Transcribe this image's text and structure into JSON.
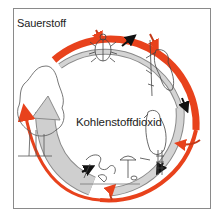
{
  "diagram": {
    "labels": {
      "oxygen": "Sauerstoff",
      "carbon_dioxide": "Kohlenstoffdioxid"
    },
    "colors": {
      "oxygen_arrow": "#e8421c",
      "co2_arrow": "#c8c8c8",
      "co2_arrow_outline": "#8a8a8a",
      "feeding_arrow": "#1a1a1a",
      "frame": "#8a8a8a"
    },
    "organisms": [
      {
        "name": "tree",
        "role": "producer"
      },
      {
        "name": "beetle",
        "role": "consumer"
      },
      {
        "name": "woodpecker",
        "role": "consumer"
      },
      {
        "name": "hawk",
        "role": "consumer"
      },
      {
        "name": "fungi and decomposers",
        "role": "decomposer"
      }
    ],
    "flows": [
      {
        "from": "tree",
        "to": "beetle",
        "type": "oxygen"
      },
      {
        "from": "beetle",
        "to": "woodpecker",
        "type": "oxygen"
      },
      {
        "from": "woodpecker",
        "to": "hawk",
        "type": "oxygen"
      },
      {
        "from": "hawk",
        "to": "decomposers",
        "type": "oxygen"
      },
      {
        "from": "decomposers",
        "to": "tree",
        "type": "carbon_dioxide"
      },
      {
        "from": "beetle",
        "to": "woodpecker",
        "type": "food"
      },
      {
        "from": "woodpecker",
        "to": "hawk",
        "type": "food"
      },
      {
        "from": "hawk",
        "to": "decomposers",
        "type": "food"
      }
    ]
  }
}
